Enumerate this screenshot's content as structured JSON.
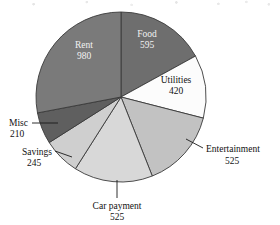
{
  "chart_data": {
    "type": "pie",
    "title": "",
    "xlabel": "",
    "ylabel": "",
    "total": 3500,
    "start_angle_deg": 0,
    "direction": "clockwise",
    "categories": [
      "Food",
      "Utilities",
      "Entertainment",
      "Car payment",
      "Savings",
      "Misc",
      "Rent"
    ],
    "values": [
      595,
      420,
      525,
      525,
      245,
      210,
      980
    ],
    "labels": [
      {
        "name": "Food",
        "value": 595,
        "text": "Food",
        "value_text": "595",
        "placement": "inside",
        "fill": "#6e6e6e",
        "text_color": "#f2f2f2"
      },
      {
        "name": "Utilities",
        "value": 420,
        "text": "Utilities",
        "value_text": "420",
        "placement": "inside",
        "fill": "#fcfcfc",
        "text_color": "#111111"
      },
      {
        "name": "Entertainment",
        "value": 525,
        "text": "Entertainment",
        "value_text": "525",
        "placement": "outside",
        "fill": "#c2c2c2",
        "text_color": "#111111"
      },
      {
        "name": "Car payment",
        "value": 525,
        "text": "Car payment",
        "value_text": "525",
        "placement": "outside",
        "fill": "#d8d8d8",
        "text_color": "#111111"
      },
      {
        "name": "Savings",
        "value": 245,
        "text": "Savings",
        "value_text": "245",
        "placement": "outside",
        "fill": "#cfcfcf",
        "text_color": "#111111"
      },
      {
        "name": "Misc",
        "value": 210,
        "text": "Misc",
        "value_text": "210",
        "placement": "outside",
        "fill": "#5f5f5f",
        "text_color": "#111111"
      },
      {
        "name": "Rent",
        "value": 980,
        "text": "Rent",
        "value_text": "980",
        "placement": "inside",
        "fill": "#7a7a7a",
        "text_color": "#f2f2f2"
      }
    ],
    "legend": "none",
    "grid": false
  },
  "slice_labels": {
    "food_name": "Food",
    "food_value": "595",
    "utilities_name": "Utilities",
    "utilities_value": "420",
    "entertainment_name": "Entertainment",
    "entertainment_value": "525",
    "car_payment_name": "Car payment",
    "car_payment_value": "525",
    "savings_name": "Savings",
    "savings_value": "245",
    "misc_name": "Misc",
    "misc_value": "210",
    "rent_name": "Rent",
    "rent_value": "980"
  },
  "colors": {
    "food": "#6e6e6e",
    "utilities": "#fcfcfc",
    "entertainment": "#c2c2c2",
    "car_payment": "#d8d8d8",
    "savings": "#cfcfcf",
    "misc": "#5f5f5f",
    "rent": "#7a7a7a",
    "outline": "#3a3a3a",
    "background": "#ffffff",
    "text": "#111111"
  }
}
